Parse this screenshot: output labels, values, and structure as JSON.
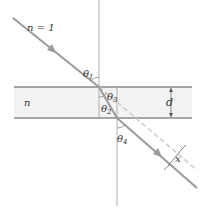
{
  "diagram": {
    "labels": {
      "outer_medium": "n = 1",
      "slab_medium": "n",
      "theta1": "θ",
      "theta1_sub": "1",
      "theta2": "θ",
      "theta2_sub": "2",
      "theta3": "θ",
      "theta3_sub": "3",
      "theta4": "θ",
      "theta4_sub": "4",
      "thickness": "d",
      "displacement": "x"
    },
    "colors": {
      "slab_fill": "#f2f2f2",
      "slab_border": "#8c8c8c",
      "ray": "#9a9a9a",
      "normal": "#a8a8a8",
      "dashed": "#c8c8c8",
      "text": "#333333"
    }
  }
}
